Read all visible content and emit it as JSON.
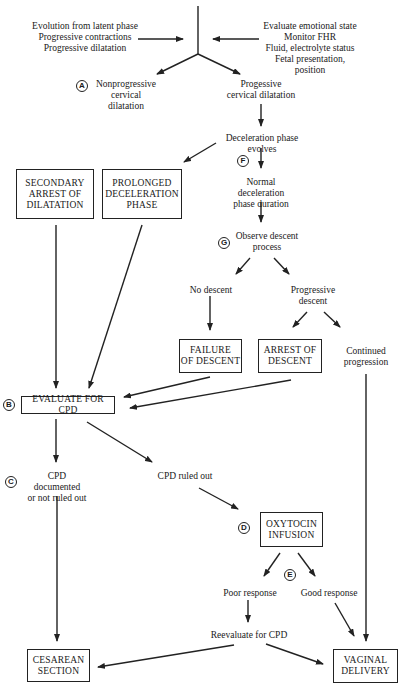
{
  "inputs": {
    "left": "Evolution from latent phase\nProgressive contractions\nProgressive dilatation",
    "right": "Evaluate emotional state\nMonitor FHR\nFluid, electrolyte status\nFetal presentation, position"
  },
  "markers": {
    "A": "A",
    "B": "B",
    "C": "C",
    "D": "D",
    "E": "E",
    "F": "F",
    "G": "G"
  },
  "labels": {
    "nonprogressive": "Nonprogressive\ncervical dilatation",
    "progressive": "Progessive\ncervical dilatation",
    "decel_evolves": "Deceleration phase evolves",
    "normal_decel": "Normal deceleration\nphase duration",
    "observe_descent": "Observe descent\nprocess",
    "no_descent": "No descent",
    "progressive_descent": "Progressive\ndescent",
    "continued_progression": "Continued\nprogression",
    "cpd_documented": "CPD documented\nor not ruled out",
    "cpd_ruled_out": "CPD ruled out",
    "poor_response": "Poor response",
    "good_response": "Good response",
    "reevaluate": "Reevaluate for CPD"
  },
  "boxes": {
    "secondary_arrest": "SECONDARY\nARREST OF\nDILATATION",
    "prolonged_decel": "PROLONGED\nDECELERATION\nPHASE",
    "failure_descent": "FAILURE\nOF DESCENT",
    "arrest_descent": "ARREST OF\nDESCENT",
    "evaluate_cpd": "EVALUATE FOR CPD",
    "oxytocin": "OXYTOCIN\nINFUSION",
    "cesarean": "CESAREAN\nSECTION",
    "vaginal": "VAGINAL\nDELIVERY"
  }
}
